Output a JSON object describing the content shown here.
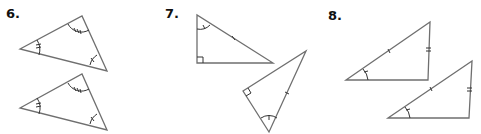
{
  "problems": [
    {
      "number": "6.",
      "description": "Two triangles with three pairs of congruent angles marked (single, double, triple arcs)"
    },
    {
      "number": "7.",
      "description": "Two right triangles with congruent hypotenuses and one pair of congruent acute angles"
    },
    {
      "number": "8.",
      "description": "Two triangles with two pairs of congruent sides and a congruent non-included angle"
    }
  ],
  "colors": {
    "stroke": "#6f6f6f",
    "mark": "#333333",
    "text": "#111111"
  }
}
